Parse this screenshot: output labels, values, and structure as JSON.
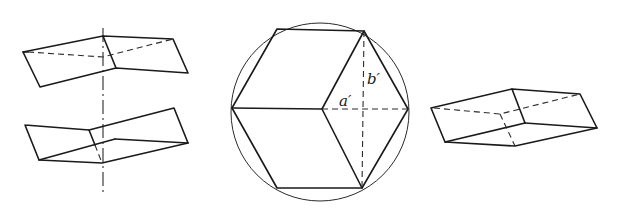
{
  "figure": {
    "panels": [
      {
        "id": "left",
        "description": "Two rhombohedral halves separated along a vertical dash-dot twin axis",
        "elements": [
          "upper-half",
          "lower-half",
          "twin-axis"
        ]
      },
      {
        "id": "center",
        "description": "Projection of rhombohedron inscribed in a circle, forming a hexagon with three rhombic faces",
        "labels": {
          "a": "a′",
          "b": "b′"
        }
      },
      {
        "id": "right",
        "description": "Rhombohedron in perspective with hidden edges dashed"
      }
    ],
    "colors": {
      "ink": "#1a1a1a",
      "background": "#ffffff"
    }
  }
}
